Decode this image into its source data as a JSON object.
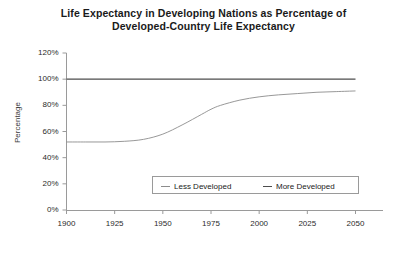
{
  "chart_data": {
    "type": "line",
    "title": "Life Expectancy in Developing Nations as Percentage of Developed-Country Life Expectancy",
    "title_line1": "Life Expectancy in Developing Nations as Percentage of",
    "title_line2": "Developed-Country Life Expectancy",
    "xlabel": "",
    "ylabel": "Percentage",
    "xlim": [
      1900,
      2050
    ],
    "ylim": [
      0,
      120
    ],
    "ytick_labels": [
      "120%",
      "100%",
      "80%",
      "60%",
      "40%",
      "20%",
      "0%"
    ],
    "ytick_values": [
      120,
      100,
      80,
      60,
      40,
      20,
      0
    ],
    "xtick_labels": [
      "1900",
      "1925",
      "1950",
      "1975",
      "2000",
      "2025",
      "2050"
    ],
    "xtick_values": [
      1900,
      1925,
      1950,
      1975,
      2000,
      2025,
      2050
    ],
    "grid": false,
    "legend_position": "inside-bottom-center",
    "x": [
      1900,
      1910,
      1920,
      1930,
      1940,
      1950,
      1960,
      1970,
      1975,
      1980,
      1990,
      2000,
      2010,
      2020,
      2030,
      2040,
      2050
    ],
    "series": [
      {
        "name": "Less Developed",
        "color": "#8c8c8c",
        "values": [
          52,
          52,
          52,
          52.5,
          54,
          58,
          65,
          73,
          77,
          80,
          84,
          86.5,
          88,
          89,
          90,
          90.5,
          91
        ]
      },
      {
        "name": "More Developed",
        "color": "#4d4d4d",
        "values": [
          100,
          100,
          100,
          100,
          100,
          100,
          100,
          100,
          100,
          100,
          100,
          100,
          100,
          100,
          100,
          100,
          100
        ]
      }
    ],
    "legend": [
      {
        "label": "Less Developed",
        "color": "#8c8c8c"
      },
      {
        "label": "More Developed",
        "color": "#4d4d4d"
      }
    ],
    "axis_color": "#9a9a9a"
  }
}
